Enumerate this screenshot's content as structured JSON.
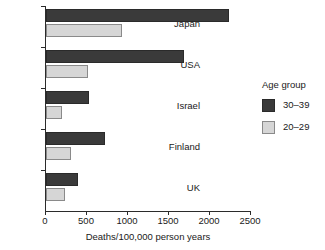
{
  "chart_data": {
    "type": "bar",
    "orientation": "horizontal",
    "title": "",
    "xlabel": "Deaths/100,000 person years",
    "ylabel": "",
    "xlim": [
      0,
      2500
    ],
    "xticks": [
      0,
      500,
      1000,
      1500,
      2000,
      2500
    ],
    "xtick_labels": [
      "0",
      "500",
      "1000",
      "1500",
      "2000",
      "2500"
    ],
    "grid": false,
    "categories": [
      "Japan",
      "USA",
      "Israel",
      "Finland",
      "UK"
    ],
    "series": [
      {
        "name": "30–39",
        "color": "#3a3a3a",
        "values": [
          2230,
          1680,
          520,
          720,
          390
        ]
      },
      {
        "name": "20–29",
        "color": "#d6d6d6",
        "values": [
          930,
          510,
          200,
          300,
          230
        ]
      }
    ],
    "legend": {
      "title": "Age group",
      "position": "right",
      "entries": [
        {
          "label": "30–39",
          "color": "#3a3a3a"
        },
        {
          "label": "20–29",
          "color": "#d6d6d6"
        }
      ]
    }
  },
  "axis": {
    "x_title": "Deaths/100,000 person years",
    "ticks": [
      {
        "label": "0",
        "value": 0
      },
      {
        "label": "500",
        "value": 500
      },
      {
        "label": "1000",
        "value": 1000
      },
      {
        "label": "1500",
        "value": 1500
      },
      {
        "label": "2000",
        "value": 2000
      },
      {
        "label": "2500",
        "value": 2500
      }
    ]
  },
  "legend": {
    "title": "Age group",
    "items": [
      {
        "label": "30–39"
      },
      {
        "label": "20–29"
      }
    ]
  }
}
